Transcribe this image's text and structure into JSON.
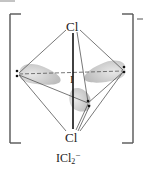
{
  "diagram": {
    "type": "molecular-geometry",
    "molecule": "ICl2-",
    "geometry": "trigonal bipyramidal electron domain, linear molecular shape",
    "atoms": {
      "top": "Cl",
      "bottom": "Cl",
      "center": "I"
    },
    "lone_pairs": 3,
    "charge": "−",
    "caption": {
      "main": "ICl",
      "subscript": "2",
      "superscript": "−"
    }
  },
  "colors": {
    "line": "#444444",
    "bond": "#111111",
    "lobe": "#d6d6d6",
    "bracket": "#555555"
  }
}
